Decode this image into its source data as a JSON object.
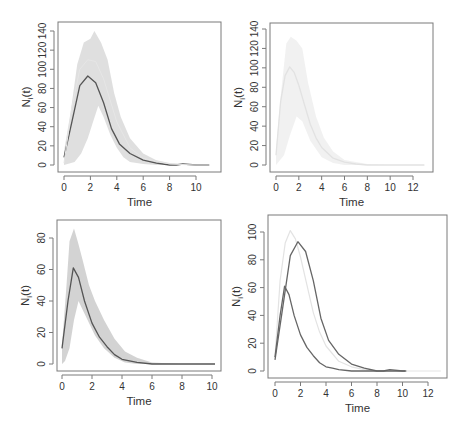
{
  "figure": {
    "panels": [
      {
        "id": "top-left",
        "xlabel": "Time",
        "ylabel": "N",
        "ylabel_sub": "i",
        "ylabel_suffix": "(t)"
      },
      {
        "id": "top-right",
        "xlabel": "Time",
        "ylabel": "N",
        "ylabel_sub": "i",
        "ylabel_suffix": "(t)"
      },
      {
        "id": "bottom-left",
        "xlabel": "Time",
        "ylabel": "N",
        "ylabel_sub": "i",
        "ylabel_suffix": "(t)"
      },
      {
        "id": "bottom-right",
        "xlabel": "Time",
        "ylabel": "N",
        "ylabel_sub": "i",
        "ylabel_suffix": "(t)"
      }
    ]
  },
  "chart_data": [
    {
      "type": "line",
      "title": "",
      "xlabel": "Time",
      "ylabel": "N_i(t)",
      "xlim": [
        0,
        11
      ],
      "ylim": [
        0,
        140
      ],
      "xticks": [
        0,
        2,
        4,
        6,
        8,
        10
      ],
      "yticks": [
        0,
        20,
        40,
        60,
        80,
        100,
        120,
        140
      ],
      "grid": false,
      "box": {
        "x": 58,
        "y": 22,
        "w": 163,
        "h": 150
      },
      "px": {
        "x0": 64,
        "x1": 196,
        "xv0": 0,
        "xv1": 10,
        "y0": 165,
        "y1": 31,
        "yv0": 0,
        "yv1": 140
      },
      "envelope": {
        "color": "#d4d4d4",
        "opacity": 0.75,
        "upper": [
          [
            0,
            14
          ],
          [
            0.5,
            55
          ],
          [
            1,
            105
          ],
          [
            1.5,
            128
          ],
          [
            2,
            132
          ],
          [
            2.3,
            140
          ],
          [
            2.8,
            128
          ],
          [
            3.3,
            110
          ],
          [
            3.8,
            75
          ],
          [
            4.3,
            50
          ],
          [
            5,
            28
          ],
          [
            6,
            12
          ],
          [
            7,
            5
          ],
          [
            8,
            2
          ],
          [
            9,
            1
          ],
          [
            11,
            0
          ]
        ],
        "lower": [
          [
            11,
            0
          ],
          [
            9,
            0
          ],
          [
            8,
            0
          ],
          [
            7,
            0
          ],
          [
            6,
            1
          ],
          [
            5,
            3
          ],
          [
            4.5,
            8
          ],
          [
            4,
            18
          ],
          [
            3.5,
            32
          ],
          [
            3,
            50
          ],
          [
            2.6,
            62
          ],
          [
            2.2,
            45
          ],
          [
            1.8,
            28
          ],
          [
            1.3,
            12
          ],
          [
            0.8,
            3
          ],
          [
            0,
            0
          ]
        ]
      },
      "series": [
        {
          "name": "mean",
          "color": "#555555",
          "width": 1.3,
          "x": [
            0,
            0.6,
            1.2,
            1.8,
            2.4,
            3.0,
            3.6,
            4.2,
            5.0,
            6.0,
            7.0,
            8.0,
            8.5,
            9.0,
            10.0,
            11.0
          ],
          "y": [
            8,
            45,
            83,
            93,
            86,
            65,
            38,
            22,
            12,
            5,
            2,
            0,
            0,
            1,
            0,
            0
          ]
        },
        {
          "name": "reference-curve",
          "color": "#e6e6e6",
          "width": 1,
          "x": [
            0,
            0.6,
            1.2,
            1.8,
            2.4,
            3,
            4,
            5,
            6,
            8,
            10,
            11
          ],
          "y": [
            2,
            60,
            100,
            110,
            108,
            90,
            45,
            18,
            7,
            1,
            0,
            0
          ]
        }
      ]
    },
    {
      "type": "line",
      "title": "",
      "xlabel": "Time",
      "ylabel": "N_i(t)",
      "xlim": [
        0,
        13
      ],
      "ylim": [
        0,
        140
      ],
      "xticks": [
        0,
        2,
        4,
        6,
        8,
        10,
        12
      ],
      "yticks": [
        0,
        20,
        40,
        60,
        80,
        100,
        120,
        140
      ],
      "grid": false,
      "box": {
        "x": 270,
        "y": 23,
        "w": 163,
        "h": 149
      },
      "px": {
        "x0": 276,
        "x1": 413,
        "xv0": 0,
        "xv1": 12,
        "y0": 165,
        "y1": 29,
        "yv0": 0,
        "yv1": 140
      },
      "envelope": {
        "color": "#f0f0f0",
        "opacity": 0.9,
        "upper": [
          [
            0,
            15
          ],
          [
            0.4,
            70
          ],
          [
            0.9,
            125
          ],
          [
            1.3,
            132
          ],
          [
            1.8,
            128
          ],
          [
            2.3,
            120
          ],
          [
            2.8,
            85
          ],
          [
            3.5,
            50
          ],
          [
            4.2,
            28
          ],
          [
            5,
            14
          ],
          [
            6,
            5
          ],
          [
            8,
            1
          ],
          [
            10,
            0
          ],
          [
            13,
            0
          ]
        ],
        "lower": [
          [
            13,
            0
          ],
          [
            10,
            0
          ],
          [
            8,
            0
          ],
          [
            6,
            0
          ],
          [
            5,
            2
          ],
          [
            4,
            8
          ],
          [
            3,
            25
          ],
          [
            2.3,
            45
          ],
          [
            1.8,
            50
          ],
          [
            1.2,
            30
          ],
          [
            0.7,
            10
          ],
          [
            0,
            0
          ]
        ]
      },
      "series": [
        {
          "name": "mean",
          "color": "#e2e2e2",
          "width": 1.3,
          "x": [
            0,
            0.4,
            0.8,
            1.2,
            1.6,
            2.0,
            2.5,
            3.0,
            3.5,
            4.0,
            5.0,
            6.0,
            7.0,
            8.0,
            10.0,
            13.0
          ],
          "y": [
            10,
            65,
            92,
            101,
            95,
            82,
            62,
            42,
            28,
            18,
            7,
            3,
            1,
            0,
            0,
            0
          ]
        }
      ]
    },
    {
      "type": "line",
      "title": "",
      "xlabel": "Time",
      "ylabel": "N_i(t)",
      "xlim": [
        0,
        10.5
      ],
      "ylim": [
        0,
        85
      ],
      "xticks": [
        0,
        2,
        4,
        6,
        8,
        10
      ],
      "yticks": [
        0,
        20,
        40,
        60,
        80
      ],
      "grid": false,
      "box": {
        "x": 57,
        "y": 220,
        "w": 164,
        "h": 151
      },
      "px": {
        "x0": 62,
        "x1": 212,
        "xv0": 0,
        "xv1": 10,
        "y0": 364,
        "y1": 238,
        "yv0": 0,
        "yv1": 80
      },
      "envelope": {
        "color": "#c8c8c8",
        "opacity": 0.8,
        "upper": [
          [
            0,
            12
          ],
          [
            0.3,
            50
          ],
          [
            0.5,
            78
          ],
          [
            0.8,
            86
          ],
          [
            1.1,
            76
          ],
          [
            1.4,
            65
          ],
          [
            1.8,
            50
          ],
          [
            2.2,
            40
          ],
          [
            2.8,
            28
          ],
          [
            3.5,
            16
          ],
          [
            4.2,
            8
          ],
          [
            5,
            4
          ],
          [
            6,
            1
          ],
          [
            8,
            0
          ],
          [
            10.2,
            0
          ]
        ],
        "lower": [
          [
            10.2,
            0
          ],
          [
            8,
            0
          ],
          [
            6,
            0
          ],
          [
            5,
            0
          ],
          [
            4.2,
            1
          ],
          [
            3.5,
            4
          ],
          [
            2.8,
            10
          ],
          [
            2.2,
            18
          ],
          [
            1.8,
            26
          ],
          [
            1.4,
            34
          ],
          [
            1.1,
            40
          ],
          [
            0.8,
            28
          ],
          [
            0.5,
            10
          ],
          [
            0.2,
            2
          ],
          [
            0,
            0
          ]
        ]
      },
      "series": [
        {
          "name": "mean",
          "color": "#555555",
          "width": 1.3,
          "x": [
            0,
            0.4,
            0.75,
            1.1,
            1.5,
            2.0,
            2.5,
            3.0,
            3.5,
            4.0,
            4.5,
            5.0,
            6.0,
            7.0,
            8.0,
            10.2
          ],
          "y": [
            10,
            40,
            61,
            55,
            40,
            26,
            17,
            11,
            6,
            3,
            2,
            1,
            0,
            0,
            0,
            0
          ]
        }
      ]
    },
    {
      "type": "line",
      "title": "",
      "xlabel": "Time",
      "ylabel": "N_i(t)",
      "xlim": [
        0,
        13
      ],
      "ylim": [
        0,
        105
      ],
      "xticks": [
        0,
        2,
        4,
        6,
        8,
        10,
        12
      ],
      "yticks": [
        0,
        20,
        40,
        60,
        80,
        100
      ],
      "grid": false,
      "box": {
        "x": 268,
        "y": 215,
        "w": 179,
        "h": 163
      },
      "px": {
        "x0": 275,
        "x1": 428,
        "xv0": 0,
        "xv1": 12,
        "y0": 371,
        "y1": 232,
        "yv0": 0,
        "yv1": 100
      },
      "envelope": null,
      "series": [
        {
          "name": "mean-panel-2",
          "color": "#e3e3e3",
          "width": 1.2,
          "x": [
            0,
            0.4,
            0.8,
            1.2,
            1.6,
            2.0,
            2.5,
            3.0,
            3.5,
            4.0,
            5.0,
            6.0,
            7.0,
            8.0,
            10.0,
            13.0
          ],
          "y": [
            10,
            65,
            92,
            101,
            95,
            82,
            62,
            42,
            28,
            18,
            7,
            3,
            1,
            0,
            0,
            0
          ]
        },
        {
          "name": "mean-panel-1",
          "color": "#666666",
          "width": 1.3,
          "x": [
            0,
            0.6,
            1.2,
            1.8,
            2.4,
            3.0,
            3.6,
            4.2,
            5.0,
            6.0,
            7.0,
            8.0,
            8.5,
            9.0,
            10.0,
            10.3
          ],
          "y": [
            8,
            45,
            83,
            93,
            86,
            65,
            38,
            22,
            12,
            5,
            2,
            0,
            0,
            1,
            0,
            0
          ]
        },
        {
          "name": "mean-panel-3",
          "color": "#666666",
          "width": 1.3,
          "x": [
            0,
            0.4,
            0.75,
            1.1,
            1.5,
            2.0,
            2.5,
            3.0,
            3.5,
            4.0,
            4.5,
            5.0,
            6.0,
            7.0,
            8.0,
            10.2
          ],
          "y": [
            10,
            40,
            61,
            55,
            40,
            26,
            17,
            11,
            6,
            3,
            2,
            1,
            0,
            0,
            0,
            0
          ]
        }
      ]
    }
  ]
}
